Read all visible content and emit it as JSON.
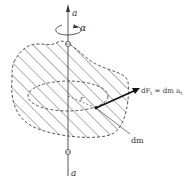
{
  "diagram": {
    "type": "rigid-body-rotation",
    "axis_label_top": "a",
    "axis_label_bottom": "a",
    "angular_accel_label": "α",
    "radius_label": "r",
    "mass_element_label": "dm",
    "force_label_prefix": "dF",
    "force_label_sub": "t",
    "force_label_eq": " = dm a",
    "force_label_eq_sub": "t",
    "colors": {
      "line": "#444444",
      "hatch": "#555555",
      "force_arrow": "#111111"
    }
  }
}
